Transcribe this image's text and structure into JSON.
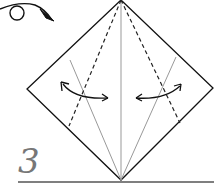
{
  "diagram": {
    "type": "origami-fold-instruction",
    "step_number": "3",
    "colors": {
      "outline": "#111111",
      "crease": "#999999",
      "valley_fold": "#222222",
      "step_number": "#777777",
      "background": "#ffffff"
    },
    "elements": [
      "flip-over-arrow",
      "diamond-outline",
      "center-crease",
      "left-valley-fold-dashed",
      "right-valley-fold-dashed",
      "left-diagonal-crease",
      "right-diagonal-crease",
      "left-fold-arrow",
      "right-fold-arrow",
      "baseline"
    ]
  }
}
